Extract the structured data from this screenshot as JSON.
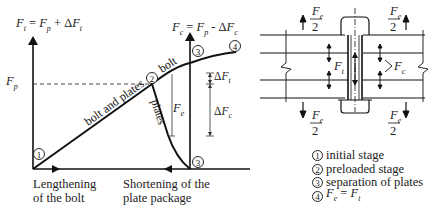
{
  "diagram": {
    "graph": {
      "y_axis_label_left": "F_t = F_p + ΔF_t",
      "y_axis_label_right": "F_c = F_p - ΔF_c",
      "preload_label": "F_p",
      "curve_labels": {
        "bolt_and_plates": "bolt and plates",
        "bolt": "bolt",
        "plates": "plates"
      },
      "dimension_labels": {
        "fe": "F_e",
        "delta_ft": "ΔF_t",
        "delta_fc": "ΔF_c"
      },
      "points": [
        "1",
        "2",
        "3",
        "3",
        "4"
      ],
      "x_axis_left_label_line1": "Lengthening",
      "x_axis_left_label_line2": "of the bolt",
      "x_axis_right_label_line1": "Shortening of the",
      "x_axis_right_label_line2": "plate package"
    },
    "joint": {
      "top_left_force": "F_e / 2",
      "top_right_force": "F_e / 2",
      "bottom_left_force": "F_e / 2",
      "bottom_right_force": "F_e / 2",
      "bolt_force": "F_t",
      "plate_force": "F_c"
    },
    "legend": [
      {
        "num": "1",
        "text": "initial stage"
      },
      {
        "num": "2",
        "text": "preloaded stage"
      },
      {
        "num": "3",
        "text": "separation of plates"
      },
      {
        "num": "4",
        "text": "F_e = F_t"
      }
    ]
  }
}
